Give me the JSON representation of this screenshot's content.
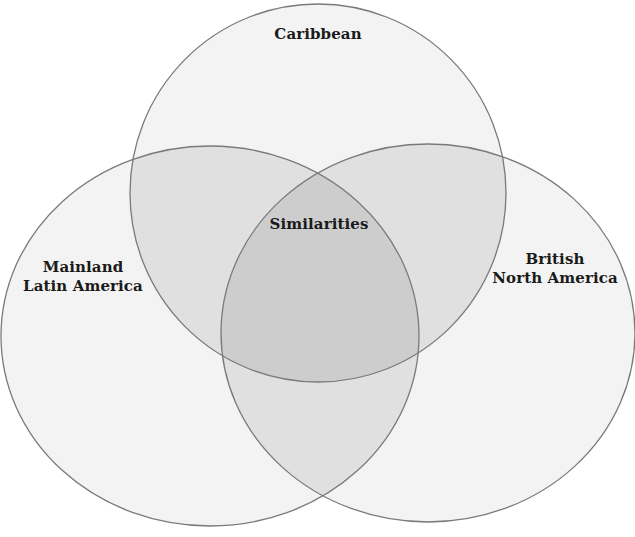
{
  "diagram": {
    "type": "venn",
    "sets": [
      {
        "id": "caribbean",
        "label_lines": [
          "Caribbean"
        ],
        "shape": {
          "cx": 318,
          "cy": 193,
          "rx": 188,
          "ry": 189
        }
      },
      {
        "id": "mainland",
        "label_lines": [
          "Mainland",
          "Latin America"
        ],
        "shape": {
          "cx": 210,
          "cy": 336,
          "rx": 209,
          "ry": 190
        }
      },
      {
        "id": "british",
        "label_lines": [
          "British",
          "North America"
        ],
        "shape": {
          "cx": 428,
          "cy": 333,
          "rx": 207,
          "ry": 189
        }
      }
    ],
    "center_label": "Similarities",
    "colors": {
      "background": "#ffffff",
      "single_fill": "#f2f2f2",
      "double_fill": "#dedede",
      "triple_fill": "#cbcbcb",
      "stroke": "#7a7a7a"
    }
  }
}
